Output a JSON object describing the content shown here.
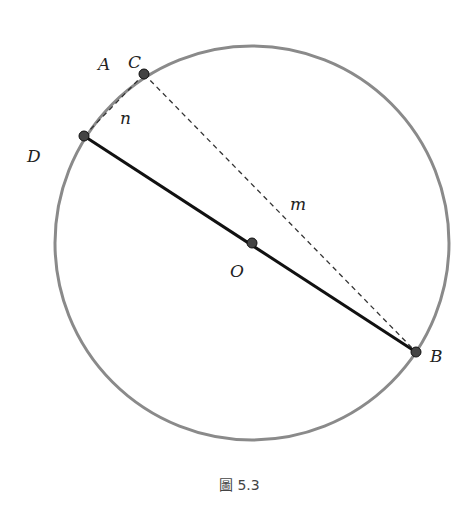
{
  "figure": {
    "caption": "圖 5.3",
    "circle": {
      "cx": 252,
      "cy": 243,
      "r": 197,
      "color": "#8a8a8a"
    },
    "points": {
      "A": {
        "label": "A"
      },
      "B": {
        "label": "B",
        "x": 416,
        "y": 352
      },
      "C": {
        "label": "C",
        "x": 144,
        "y": 74
      },
      "D": {
        "label": "D",
        "x": 84,
        "y": 136
      },
      "O": {
        "label": "O",
        "x": 252,
        "y": 243
      }
    },
    "segments": {
      "n": {
        "label": "n"
      },
      "m": {
        "label": "m"
      }
    }
  }
}
